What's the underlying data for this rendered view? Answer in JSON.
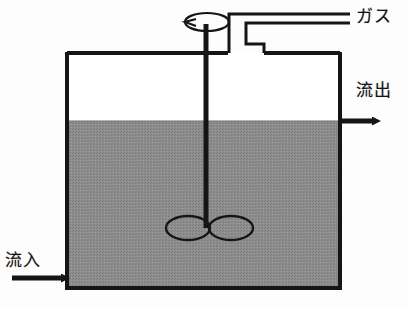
{
  "figure": {
    "type": "process-equipment-schematic"
  },
  "labels": {
    "gas": "ガス",
    "outflow": "流出",
    "inflow": "流入"
  },
  "colors": {
    "liquid_fill": "#8d8d8d",
    "outline": "#1a1a1a",
    "background": "#fdfdfd",
    "vessel_headspace": "#ffffff"
  },
  "geometry": {
    "vessel": {
      "left": 67,
      "top": 52,
      "right": 340,
      "bottom": 288,
      "wall_thickness": 4
    },
    "liquid_level_y": 121,
    "shaft": {
      "x": 206,
      "top": 24,
      "bottom": 226,
      "thickness": 5
    },
    "rotation_indicator": {
      "cx": 207,
      "cy": 22,
      "rx": 22,
      "ry": 9
    },
    "impeller": {
      "left_blade": {
        "cx": 189,
        "cy": 228,
        "rx": 22,
        "ry": 12
      },
      "right_blade": {
        "cx": 231,
        "cy": 228,
        "rx": 22,
        "ry": 12
      }
    },
    "gas_pipe": {
      "entry_x": 246,
      "outer_top_y": 14,
      "inner_top_y": 23,
      "drop_y": 52
    },
    "inflow_arrow": {
      "from_x": 12,
      "to_x": 68,
      "y": 278
    },
    "outflow_arrow": {
      "from_x": 340,
      "to_x": 381,
      "y": 121
    }
  },
  "elements": {
    "vessel_name": "reactor-vessel",
    "liquid_name": "liquid-contents",
    "shaft_name": "agitator-shaft",
    "impeller_name": "impeller-blades",
    "rotation_name": "rotation-indicator",
    "gas_pipe_name": "gas-inlet-pipe",
    "inflow_arrow_name": "inflow-arrow",
    "outflow_arrow_name": "outflow-arrow"
  }
}
